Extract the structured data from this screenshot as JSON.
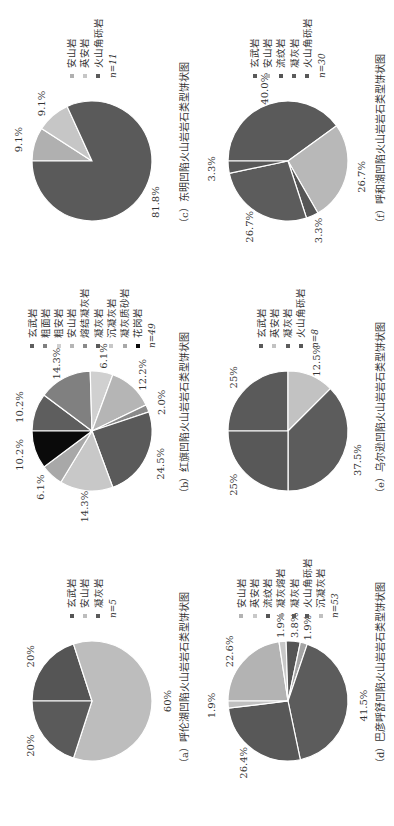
{
  "chart_data": [
    {
      "id": "a",
      "type": "pie",
      "title": "（a）呼伦湖凹陷火山岩岩石类型饼状图",
      "n_label": "n=5",
      "categories": [
        "玄武岩",
        "安山岩",
        "凝灰岩"
      ],
      "values": [
        20,
        60,
        20
      ],
      "labels": [
        "20%",
        "60%",
        "20%"
      ],
      "colors": [
        "#555555",
        "#bdbdbd",
        "#5a5a5a"
      ],
      "legend_position": "right"
    },
    {
      "id": "b",
      "type": "pie",
      "title": "（b）红旗凹陷火山岩岩石类型饼状图",
      "n_label": "n=49",
      "categories": [
        "玄武岩",
        "粗面岩",
        "粗安岩",
        "安山岩",
        "熔结凝灰岩",
        "凝灰岩",
        "沉凝灰岩",
        "凝灰质砂岩",
        "花岗岩"
      ],
      "values": [
        10.2,
        14.3,
        6.1,
        12.2,
        2.0,
        24.5,
        14.3,
        6.1,
        10.2
      ],
      "labels": [
        "10.2%",
        "14.3%",
        "6.1%",
        "12.2%",
        "2.0%",
        "24.5%",
        "14.3%",
        "6.1%",
        "10.2%"
      ],
      "colors": [
        "#5e5e5e",
        "#808080",
        "#d0d0d0",
        "#b5b5b5",
        "#8a8a8a",
        "#5a5a5a",
        "#c8c8c8",
        "#a8a8a8",
        "#0a0a0a"
      ],
      "legend_position": "right"
    },
    {
      "id": "c",
      "type": "pie",
      "title": "（c）东明凹陷火山岩岩石类型饼状图",
      "n_label": "n=11",
      "categories": [
        "安山岩",
        "英安岩",
        "火山角砾岩"
      ],
      "values": [
        9.1,
        9.1,
        81.8
      ],
      "labels": [
        "9.1%",
        "9.1%",
        "81.8%"
      ],
      "colors": [
        "#b0b0b0",
        "#c6c6c6",
        "#5a5a5a"
      ],
      "legend_position": "right"
    },
    {
      "id": "d",
      "type": "pie",
      "title": "（d）巴彦呼舒凹陷火山岩岩石类型饼状图",
      "n_label": "n=53",
      "categories": [
        "安山岩",
        "英安岩",
        "流纹岩",
        "凝灰熔岩",
        "凝灰岩",
        "火山角砾岩",
        "沉凝灰岩"
      ],
      "values": [
        22.6,
        1.9,
        3.8,
        1.9,
        41.5,
        26.4,
        1.9
      ],
      "labels": [
        "22.6%",
        "1.9%",
        "3.8%",
        "1.9%",
        "41.5%",
        "26.4%",
        "1.9%"
      ],
      "colors": [
        "#b3b3b3",
        "#c8c8c8",
        "#555555",
        "#a5a5a5",
        "#5c5c5c",
        "#585858",
        "#c0c0c0"
      ],
      "legend_position": "right"
    },
    {
      "id": "e",
      "type": "pie",
      "title": "（e）乌尔逊凹陷火山岩岩石类型饼状图",
      "n_label": "n=8",
      "categories": [
        "玄武岩",
        "英安岩",
        "凝灰岩",
        "火山角砾岩"
      ],
      "values": [
        25,
        12.5,
        37.5,
        25
      ],
      "labels": [
        "25%",
        "12.5%",
        "37.5%",
        "25%"
      ],
      "colors": [
        "#5a5a5a",
        "#c2c2c2",
        "#5c5c5c",
        "#585858"
      ],
      "legend_position": "right"
    },
    {
      "id": "f",
      "type": "pie",
      "title": "（f）呼和湖凹陷火山岩岩石类型饼状图",
      "n_label": "n=30",
      "categories": [
        "玄武岩",
        "安山岩",
        "流纹岩",
        "凝灰岩",
        "火山角砾岩"
      ],
      "values": [
        40.0,
        26.7,
        3.3,
        26.7,
        3.3
      ],
      "labels": [
        "40.0%",
        "26.7%",
        "3.3%",
        "26.7%",
        "3.3%"
      ],
      "colors": [
        "#5a5a5a",
        "#b8b8b8",
        "#555555",
        "#5c5c5c",
        "#585858"
      ],
      "legend_position": "right"
    }
  ]
}
